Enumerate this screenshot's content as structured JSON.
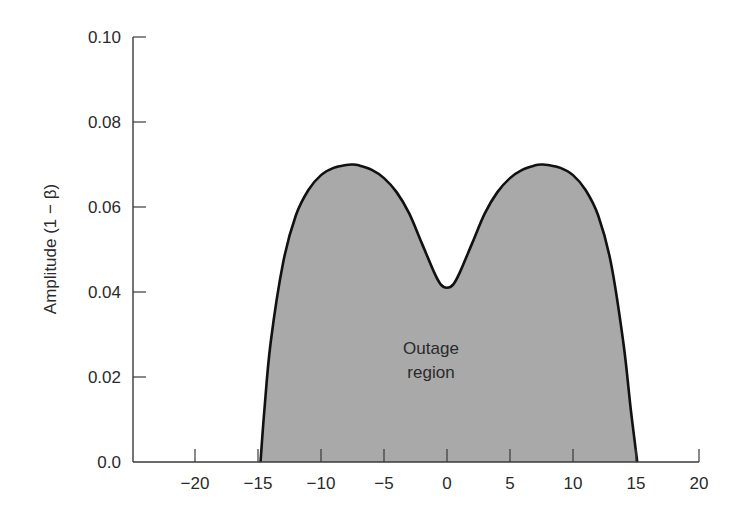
{
  "chart_data": {
    "type": "area",
    "title": "",
    "xlabel": "",
    "ylabel": "Amplitude (1 − β)",
    "xlim": [
      -25,
      20
    ],
    "ylim": [
      0.0,
      0.1
    ],
    "grid": false,
    "legend": null,
    "x_ticks": [
      -20,
      -15,
      -10,
      -5,
      0,
      5,
      10,
      15,
      20
    ],
    "x_tick_labels": [
      "−20",
      "−15",
      "−10",
      "−5",
      "0",
      "5",
      "10",
      "15",
      "20"
    ],
    "y_ticks": [
      0.0,
      0.02,
      0.04,
      0.06,
      0.08,
      0.1
    ],
    "y_tick_labels": [
      "0.0",
      "0.02",
      "0.04",
      "0.06",
      "0.08",
      "0.10"
    ],
    "series": [
      {
        "name": "Outage region boundary",
        "fill": "#a9a9a9",
        "stroke": "#111111",
        "x": [
          -14.8,
          -14.5,
          -14.0,
          -13.0,
          -12.0,
          -11.0,
          -10.0,
          -9.0,
          -8.0,
          -7.5,
          -7.0,
          -6.0,
          -5.0,
          -4.0,
          -3.0,
          -2.0,
          -1.0,
          -0.5,
          0.0,
          0.5,
          1.0,
          2.0,
          3.0,
          4.0,
          5.0,
          6.0,
          7.0,
          7.5,
          8.0,
          9.0,
          10.0,
          11.0,
          12.0,
          13.0,
          14.0,
          14.6,
          15.1
        ],
        "y": [
          0.0,
          0.012,
          0.028,
          0.047,
          0.058,
          0.064,
          0.0675,
          0.0692,
          0.0699,
          0.07,
          0.0698,
          0.0688,
          0.0668,
          0.0635,
          0.0585,
          0.0515,
          0.0445,
          0.0418,
          0.041,
          0.0418,
          0.0445,
          0.0515,
          0.0585,
          0.0635,
          0.0668,
          0.0688,
          0.0698,
          0.07,
          0.0699,
          0.0692,
          0.0675,
          0.064,
          0.058,
          0.047,
          0.028,
          0.012,
          0.0
        ]
      }
    ],
    "annotations": [
      {
        "text": "Outage\nregion",
        "x": 0,
        "y": 0.022
      }
    ]
  },
  "labels": {
    "ylabel": "Amplitude (1 − β)",
    "annotation_line1": "Outage",
    "annotation_line2": "region"
  },
  "colors": {
    "fill": "#a9a9a9",
    "stroke": "#111111",
    "axis": "#3a3a3a",
    "text": "#2a2a2a"
  }
}
